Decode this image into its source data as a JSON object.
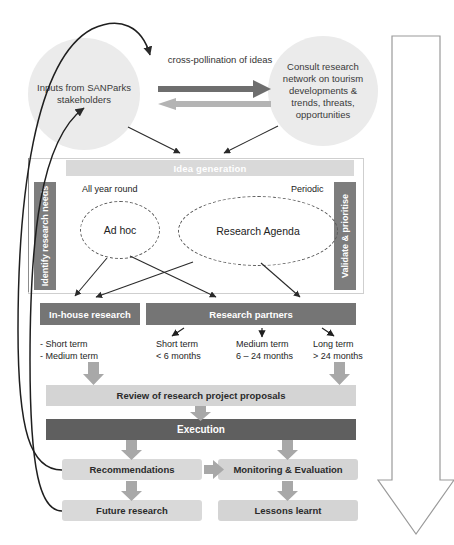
{
  "diagram": {
    "colors": {
      "circle_fill": "#ebebeb",
      "bar_dark": "#757575",
      "bar_execution": "#5f5f5f",
      "bar_light": "#d4d4d4",
      "bar_pale": "#d9d9d9",
      "idea_bar": "#d9d9d9",
      "side_tab": "#7d7d7d",
      "arrow_gray": "#a8a8a8",
      "arrow_dark": "#6e6e6e",
      "outline_arrow_stroke": "#9a9a9a",
      "text_dark": "#222222",
      "text_white": "#ffffff"
    },
    "circles": {
      "left": "Inputs from SANParks stakeholders",
      "right": "Consult research network on tourism developments & trends, threats, opportunities"
    },
    "cross_pollination_label": "cross-pollination of ideas",
    "idea_generation": "Idea generation",
    "side_tabs": {
      "left": "Identify research needs",
      "right": "Validate & prioritise"
    },
    "frequency_labels": {
      "left": "All year round",
      "right": "Periodic"
    },
    "ellipses": {
      "ad_hoc": "Ad hoc",
      "research_agenda": "Research Agenda"
    },
    "research_routes": {
      "in_house": "In-house research",
      "partners": "Research partners"
    },
    "terms": {
      "in_house": [
        "- Short term",
        "- Medium term"
      ],
      "short": [
        "Short term",
        "< 6 months"
      ],
      "medium": [
        "Medium term",
        "6 – 24 months"
      ],
      "long": [
        "Long term",
        "> 24 months"
      ]
    },
    "stages": {
      "review": "Review of research project proposals",
      "execution": "Execution",
      "recommendations": "Recommendations",
      "monitoring": "Monitoring & Evaluation",
      "future_research": "Future research",
      "lessons_learnt": "Lessons learnt"
    },
    "side_arrow_text": "Develop strong relationships and agreements with tertiary institutions, government ministries, parastatals, industry bodies"
  }
}
